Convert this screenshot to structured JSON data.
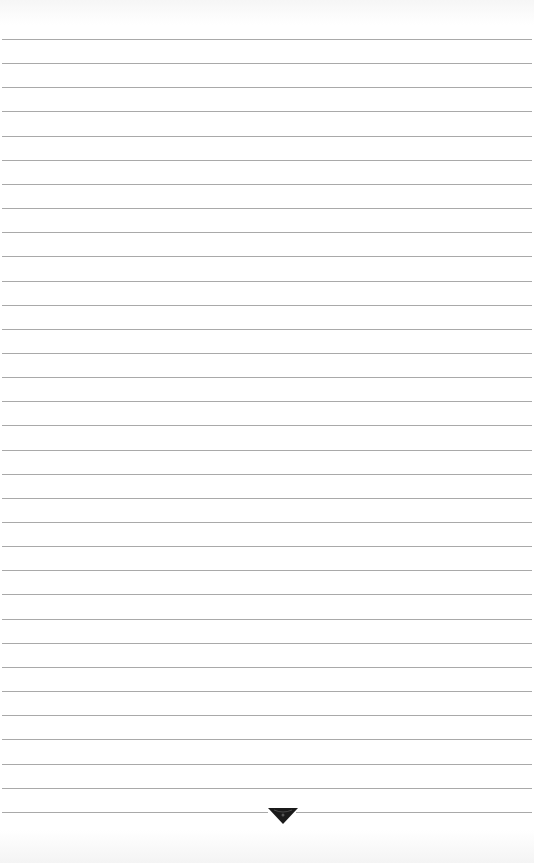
{
  "page": {
    "type": "lined-paper",
    "line_count": 33,
    "first_line_y": 39,
    "line_spacing": 24.15,
    "line_color": "#a9a9a9",
    "background_color": "#ffffff"
  },
  "ornament": {
    "icon": "downward-triangle-ornament-icon",
    "color": "#1a1a1a"
  }
}
